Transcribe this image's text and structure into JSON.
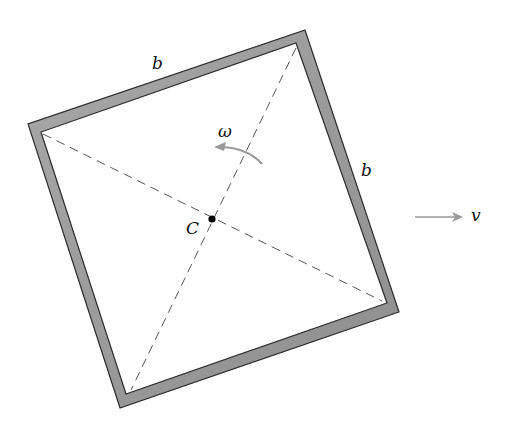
{
  "diagram": {
    "type": "rotating square frame",
    "labels": {
      "side_top": "b",
      "side_right": "b",
      "center": "C",
      "angular_velocity": "ω",
      "velocity": "v"
    },
    "colors": {
      "frame_fill": "#9a9a9a",
      "frame_edge": "#2a2a2a",
      "dashed_line": "#555555",
      "arrow": "#999999",
      "text": "#111111"
    }
  }
}
